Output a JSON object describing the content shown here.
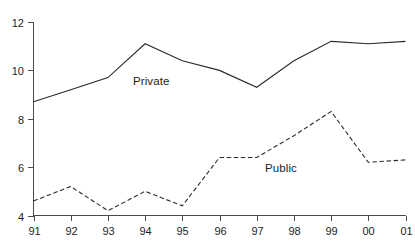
{
  "chart_data": {
    "type": "line",
    "title": "",
    "subtitle": "",
    "xlabel": "",
    "ylabel": "",
    "grid": false,
    "legend_position": "inline-annotations",
    "x": [
      "91",
      "92",
      "93",
      "94",
      "95",
      "96",
      "97",
      "98",
      "99",
      "00",
      "01"
    ],
    "categories": [
      "91",
      "92",
      "93",
      "94",
      "95",
      "96",
      "97",
      "98",
      "99",
      "00",
      "01"
    ],
    "xlim": [
      "91",
      "01"
    ],
    "ylim": [
      4,
      12
    ],
    "yticks": [
      4,
      6,
      8,
      10,
      12
    ],
    "ytick_labels": [
      "4",
      "6",
      "8",
      "10",
      "12"
    ],
    "xtick_labels": [
      "91",
      "92",
      "93",
      "94",
      "95",
      "96",
      "97",
      "98",
      "99",
      "00",
      "01"
    ],
    "series": [
      {
        "name": "Private",
        "style": "solid",
        "color": "#2b2b2b",
        "values": [
          8.7,
          9.2,
          9.7,
          11.1,
          10.4,
          10.0,
          9.3,
          10.4,
          11.2,
          11.1,
          11.2
        ]
      },
      {
        "name": "Public",
        "style": "dashed",
        "color": "#2b2b2b",
        "values": [
          4.6,
          5.2,
          4.2,
          5.0,
          4.4,
          6.4,
          6.4,
          7.3,
          8.3,
          6.2,
          6.3
        ]
      }
    ],
    "annotations": [
      {
        "text": "Private",
        "series": "Private"
      },
      {
        "text": "Public",
        "series": "Public"
      }
    ]
  },
  "axes": {
    "y_tick_labels": [
      "12",
      "10",
      "8",
      "6",
      "4"
    ],
    "x_tick_labels": [
      "91",
      "92",
      "93",
      "94",
      "95",
      "96",
      "97",
      "98",
      "99",
      "00",
      "01"
    ]
  },
  "labels": {
    "private": "Private",
    "public": "Public"
  },
  "colors": {
    "line": "#2b2b2b",
    "axis": "#4a4a4a",
    "text": "#1d1d1d",
    "background": "#ffffff"
  }
}
